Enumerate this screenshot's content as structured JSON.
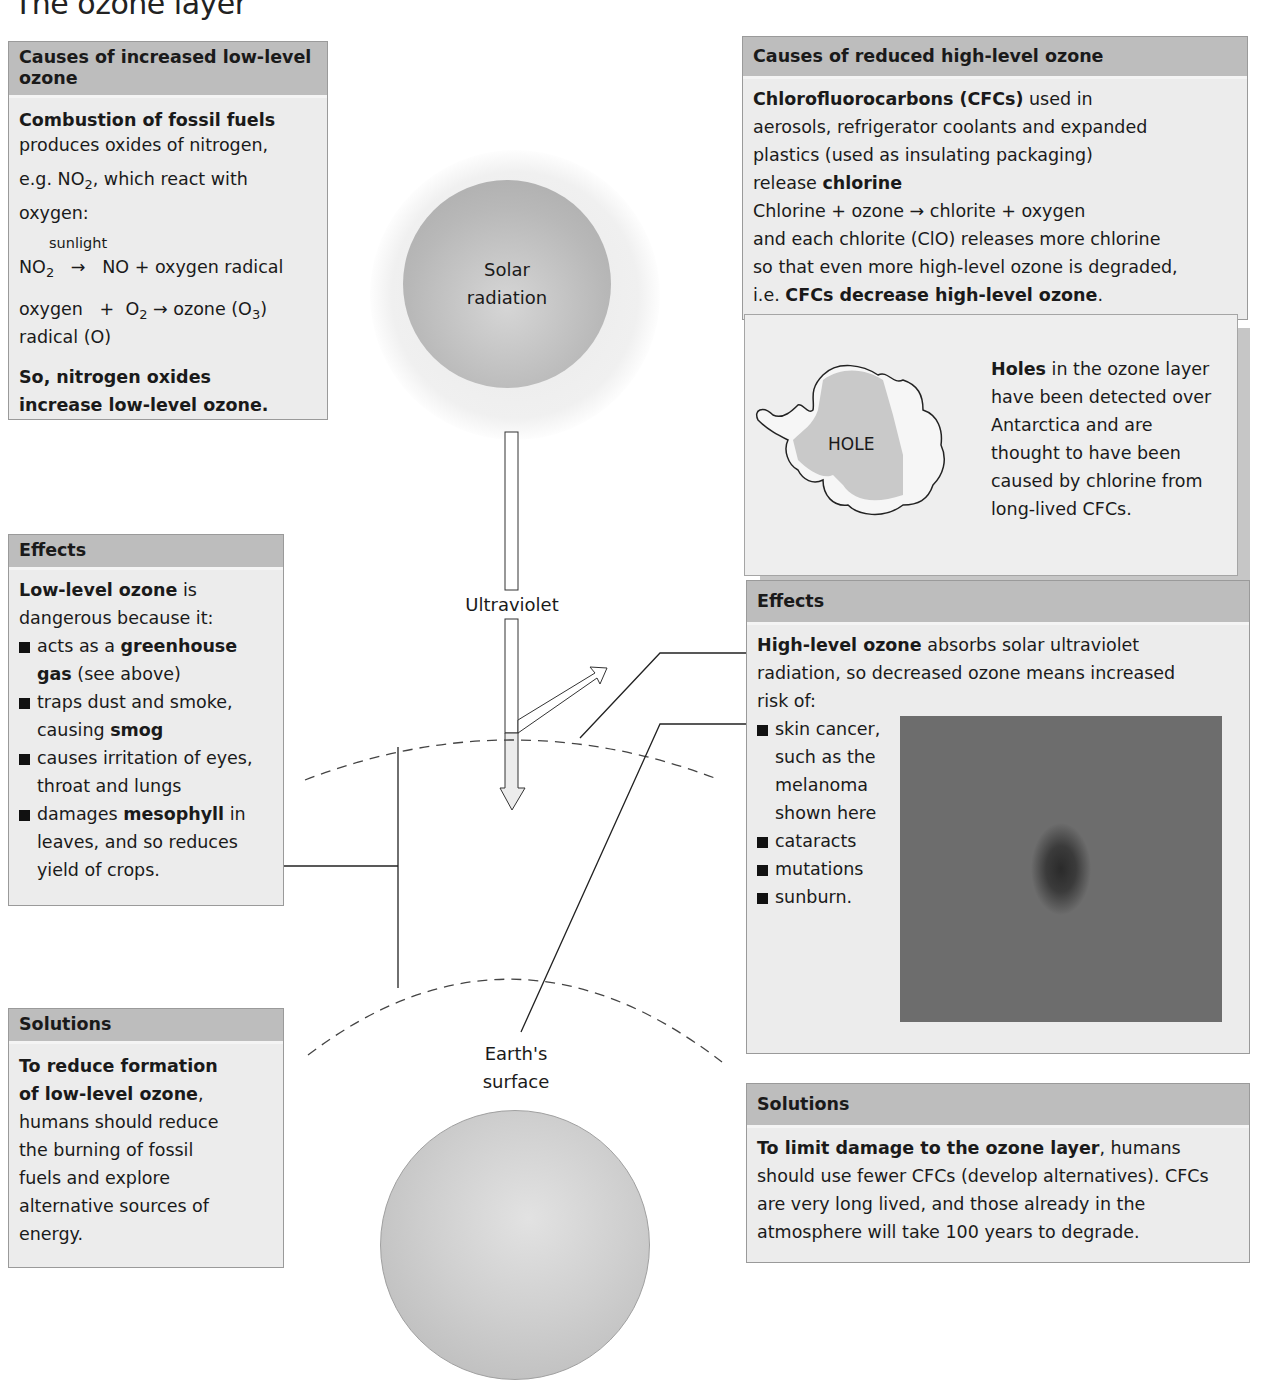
{
  "page": {
    "title": "The ozone layer"
  },
  "colors": {
    "header_bg": "#bdbdbd",
    "box_bg": "#ececec",
    "border": "#9a9a9a",
    "text": "#1a1a1a"
  },
  "low_causes": {
    "heading": "Causes of increased low-level ozone",
    "lead_bold": "Combustion of fossil fuels",
    "line1": "produces oxides of nitrogen,",
    "line2_prefix": "e.g. NO",
    "line2_sub": "2",
    "line2_suffix": ", which react with oxygen:",
    "sunlight_label": "sunlight",
    "eq1_left": "NO",
    "eq1_left_sub": "2",
    "eq1_arrow": "→",
    "eq1_right": "NO + oxygen radical",
    "eq2_left": "oxygen",
    "eq2_plus": "+",
    "eq2_mid": "O",
    "eq2_mid_sub": "2",
    "eq2_arrow": "→",
    "eq2_right": "ozone (O",
    "eq2_right_sub": "3",
    "eq2_right_close": ")",
    "eq2_left_line2": "radical (O)",
    "conclusion": "So, nitrogen oxides increase low-level ozone."
  },
  "low_effects": {
    "heading": "Effects",
    "lead_bold": "Low-level ozone",
    "lead_rest": " is dangerous because it:",
    "items": [
      {
        "pre": "acts as a ",
        "bold": "greenhouse gas",
        "post": " (see above)"
      },
      {
        "pre": "traps dust and smoke, causing ",
        "bold": "smog",
        "post": ""
      },
      {
        "pre": "causes irritation of eyes, throat and lungs",
        "bold": "",
        "post": ""
      },
      {
        "pre": "damages ",
        "bold": "mesophyll",
        "post": " in leaves, and so reduces yield of crops."
      }
    ]
  },
  "low_solutions": {
    "heading": "Solutions",
    "lead_bold": "To reduce formation of low-level ozone",
    "lead_comma": ",",
    "text": "humans should reduce the burning of fossil fuels and explore alternative sources of energy."
  },
  "high_causes": {
    "heading": "Causes of reduced high-level ozone",
    "lead_bold": "Chlorofluorocarbons (CFCs)",
    "lead_rest": " used in",
    "line2": "aerosols, refrigerator coolants and expanded",
    "line3": "plastics (used as insulating packaging)",
    "line4_pre": "release ",
    "line4_bold": "chlorine",
    "line5": "Chlorine + ozone → chlorite + oxygen",
    "line6": "and each chlorite (ClO) releases more chlorine",
    "line7": "so that even more high-level ozone is degraded,",
    "line8_pre": "i.e. ",
    "line8_bold": "CFCs decrease high-level ozone",
    "line8_post": "."
  },
  "holes": {
    "map_label": "HOLE",
    "lead_bold": "Holes",
    "text": " in the ozone layer have been detected over Antarctica and are thought to have been caused by chlorine from long-lived CFCs."
  },
  "high_effects": {
    "heading": "Effects",
    "lead_bold": "High-level ozone",
    "lead_rest": " absorbs solar ultraviolet radiation, so decreased ozone means increased risk of:",
    "items": [
      "skin cancer, such as the melanoma shown here",
      "cataracts",
      "mutations",
      "sunburn."
    ],
    "image_caption": "melanoma photo"
  },
  "high_solutions": {
    "heading": "Solutions",
    "lead_bold": "To limit damage to the ozone layer",
    "text": ", humans should use fewer CFCs (develop alternatives). CFCs are very long lived, and those already in the atmosphere will take 100 years to degrade."
  },
  "diagram": {
    "sun_line1": "Solar",
    "sun_line2": "radiation",
    "uv_label": "Ultraviolet",
    "earth_line1": "Earth's",
    "earth_line2": "surface"
  }
}
